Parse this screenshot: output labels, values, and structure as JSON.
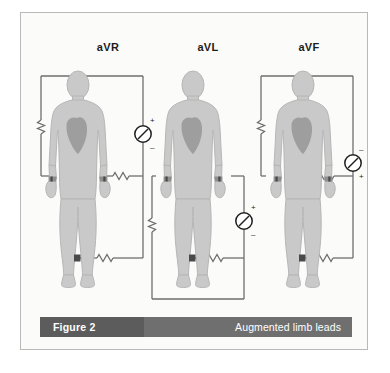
{
  "figure": {
    "caption_label": "Figure 2",
    "caption_title": "Augmented limb leads",
    "background_color": "#fbfbfa",
    "border_color": "#b9b9b9",
    "caption_left_color": "#5c5c5c",
    "caption_right_color": "#6f6f6f"
  },
  "colors": {
    "body_fill": "#c9c9c9",
    "body_stroke": "#b3b3b3",
    "heart_fill": "#9e9e9e",
    "wire": "#6e6e6e",
    "electrode": "#4a4a4a",
    "text": "#1d1d1d"
  },
  "leads": [
    {
      "name": "aVR",
      "label": "aVR",
      "meter_plus": "+",
      "meter_minus": "–",
      "meter_polarity_top": "+",
      "meter_polarity_bottom": "–",
      "resistor_count": 3,
      "electrodes": [
        "left-wrist",
        "right-wrist",
        "left-ankle"
      ]
    },
    {
      "name": "aVL",
      "label": "aVL",
      "meter_plus": "+",
      "meter_minus": "–",
      "meter_polarity_top": "+",
      "meter_polarity_bottom": "–",
      "resistor_count": 2,
      "electrodes": [
        "left-wrist",
        "right-wrist",
        "left-ankle"
      ]
    },
    {
      "name": "aVF",
      "label": "aVF",
      "meter_plus": "+",
      "meter_minus": "–",
      "meter_polarity_top": "–",
      "meter_polarity_bottom": "+",
      "resistor_count": 3,
      "electrodes": [
        "left-wrist",
        "right-wrist",
        "left-ankle"
      ]
    }
  ]
}
